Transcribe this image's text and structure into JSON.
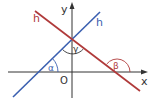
{
  "diagram": {
    "title": "",
    "axes": {
      "x_label": "x",
      "y_label": "y",
      "origin_label": "O"
    },
    "lines": [
      {
        "name": "g",
        "label": "g",
        "color": "#3a5fb0"
      },
      {
        "name": "h",
        "label": "h",
        "color": "#b03a3a"
      }
    ],
    "angles": [
      {
        "name": "alpha",
        "label": "α",
        "between": [
          "g",
          "x-axis"
        ],
        "color": "#3a5fb0"
      },
      {
        "name": "beta",
        "label": "β",
        "between": [
          "h",
          "x-axis"
        ],
        "color": "#b03a3a"
      },
      {
        "name": "gamma",
        "label": "γ",
        "between": [
          "g",
          "h"
        ],
        "color": "#333333"
      }
    ],
    "colors": {
      "axis": "#333333",
      "g": "#3a5fb0",
      "h": "#b03a3a"
    }
  }
}
